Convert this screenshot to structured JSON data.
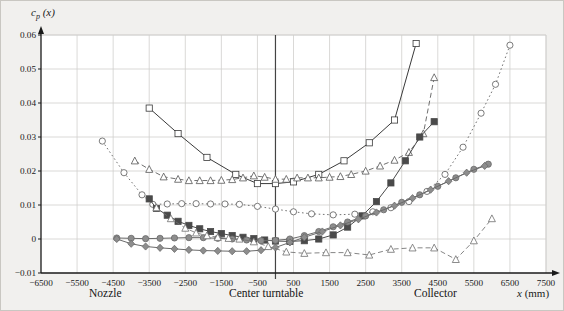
{
  "figure": {
    "background_color": "#f1f0ee",
    "plot_background_color": "#ffffff",
    "grid_color": "#d0cfcd",
    "axis_color": "#1a1a1a",
    "turntable_line_color": "#444444"
  },
  "labels": {
    "y_axis_title": "c_p (x)",
    "y_axis_title_main": "c",
    "y_axis_title_sub": "p",
    "y_axis_title_arg": "(x)",
    "x_axis_title": "x (mm)",
    "x_axis_title_main": "x",
    "x_axis_title_unit": "(mm)",
    "nozzle": "Nozzle",
    "center_turntable": "Center turntable",
    "collector": "Collector"
  },
  "chart_data": {
    "type": "line",
    "title": "",
    "xlabel": "x (mm)",
    "ylabel": "c_p (x)",
    "xlim": [
      -6500,
      7500
    ],
    "ylim": [
      -0.01,
      0.06
    ],
    "xticks": [
      -6500,
      -5500,
      -4500,
      -3500,
      -2500,
      -1500,
      -500,
      500,
      1500,
      2500,
      3500,
      4500,
      5500,
      6500,
      7500
    ],
    "xtick_labels": [
      "−6500",
      "−5500",
      "−4500",
      "−3500",
      "−2500",
      "−1500",
      "−500",
      "500",
      "1500",
      "2500",
      "3500",
      "4500",
      "5500",
      "6500",
      "7500"
    ],
    "yticks": [
      -0.01,
      0,
      0.01,
      0.02,
      0.03,
      0.04,
      0.05,
      0.06
    ],
    "ytick_labels": [
      "−0.01",
      "0",
      "0.01",
      "0.02",
      "0.03",
      "0.04",
      "0.05",
      "0.06"
    ],
    "grid": true,
    "legend": "none",
    "annotations": [
      {
        "text": "Nozzle",
        "x": -4000
      },
      {
        "text": "Center turntable",
        "x": 0
      },
      {
        "text": "Collector",
        "x": 4800
      }
    ],
    "vertical_reference_line": {
      "x": 0,
      "label": "Center turntable"
    },
    "series": [
      {
        "name": "open-square-solid",
        "marker": "square",
        "fill": "open",
        "linestyle": "solid",
        "color": "#3a3a3a",
        "x": [
          -3500,
          -2700,
          -1900,
          -1100,
          -500,
          0,
          500,
          1200,
          1900,
          2600,
          3300,
          3900
        ],
        "y": [
          0.0385,
          0.031,
          0.024,
          0.019,
          0.0163,
          0.0163,
          0.0168,
          0.019,
          0.023,
          0.0283,
          0.035,
          0.0575
        ]
      },
      {
        "name": "open-triangle-dashed-upper",
        "marker": "triangle",
        "fill": "open",
        "linestyle": "dashed",
        "color": "#555555",
        "x": [
          -3900,
          -3500,
          -3100,
          -2700,
          -2400,
          -2100,
          -1800,
          -1500,
          -1200,
          -900,
          -600,
          -300,
          0,
          300,
          600,
          900,
          1200,
          1500,
          1800,
          2100,
          2500,
          2900,
          3300,
          3700,
          4100,
          4400
        ],
        "y": [
          0.023,
          0.0205,
          0.0183,
          0.0176,
          0.0172,
          0.0172,
          0.0172,
          0.0173,
          0.0175,
          0.018,
          0.0186,
          0.0182,
          0.0176,
          0.0176,
          0.018,
          0.018,
          0.018,
          0.0182,
          0.0184,
          0.019,
          0.02,
          0.0215,
          0.0232,
          0.0255,
          0.031,
          0.0475
        ]
      },
      {
        "name": "open-circle-dotted",
        "marker": "circle",
        "fill": "open",
        "linestyle": "dotted",
        "color": "#5a5a5a",
        "x": [
          -4800,
          -4200,
          -3700,
          -3400,
          -3000,
          -2600,
          -2200,
          -1800,
          -1400,
          -1000,
          -500,
          0,
          500,
          1000,
          1600,
          2200,
          2700,
          3200,
          3700,
          4200,
          4700,
          5200,
          5700,
          6100,
          6500
        ],
        "y": [
          0.0288,
          0.0195,
          0.013,
          0.0102,
          0.0103,
          0.0104,
          0.0104,
          0.0103,
          0.0103,
          0.0102,
          0.0096,
          0.0088,
          0.008,
          0.0074,
          0.0071,
          0.0073,
          0.008,
          0.0092,
          0.011,
          0.014,
          0.019,
          0.027,
          0.037,
          0.0455,
          0.057
        ]
      },
      {
        "name": "filled-square-solid",
        "marker": "square",
        "fill": "filled",
        "linestyle": "solid",
        "color": "#4a4a4a",
        "x": [
          -3500,
          -3300,
          -3000,
          -2700,
          -2400,
          -2100,
          -1800,
          -1500,
          -1200,
          -900,
          -600,
          -300,
          0,
          400,
          800,
          1200,
          1600,
          2000,
          2400,
          2800,
          3200,
          3600,
          4000,
          4400
        ],
        "y": [
          0.0118,
          0.009,
          0.007,
          0.0052,
          0.004,
          0.003,
          0.0022,
          0.0016,
          0.001,
          0.0005,
          0.0001,
          -0.0003,
          -0.0006,
          -0.0007,
          -0.0005,
          0.0,
          0.0012,
          0.0035,
          0.0068,
          0.011,
          0.0165,
          0.023,
          0.03,
          0.0345
        ]
      },
      {
        "name": "filled-circle-solid",
        "marker": "circle",
        "fill": "shaded",
        "linestyle": "solid",
        "color": "#6a6a6a",
        "x": [
          -4400,
          -4000,
          -3600,
          -3200,
          -2800,
          -2400,
          -2000,
          -1600,
          -1200,
          -800,
          -400,
          0,
          400,
          800,
          1200,
          1600,
          2000,
          2500,
          3000,
          3500,
          4000,
          4500,
          5000,
          5500,
          5900
        ],
        "y": [
          0.0003,
          0.0002,
          0.0001,
          0.0002,
          0.0003,
          0.0004,
          0.0004,
          0.0002,
          0.0,
          -0.0003,
          -0.0005,
          -0.0004,
          0.0,
          0.001,
          0.0022,
          0.0036,
          0.005,
          0.0068,
          0.0086,
          0.0108,
          0.013,
          0.0155,
          0.018,
          0.0205,
          0.022
        ]
      },
      {
        "name": "filled-diamond-solid",
        "marker": "diamond",
        "fill": "shaded",
        "linestyle": "solid",
        "color": "#6a6a6a",
        "x": [
          -4400,
          -4000,
          -3600,
          -3200,
          -2800,
          -2400,
          -2000,
          -1600,
          -1200,
          -800,
          -400,
          0,
          400,
          800,
          1300,
          1800,
          2300,
          2800,
          3300,
          3800,
          4300,
          4800,
          5300,
          5800
        ],
        "y": [
          0.0,
          -0.0014,
          -0.0022,
          -0.0026,
          -0.0029,
          -0.0032,
          -0.0034,
          -0.0035,
          -0.0036,
          -0.0036,
          -0.0033,
          -0.0025,
          -0.001,
          0.0005,
          0.0022,
          0.004,
          0.0058,
          0.0078,
          0.0098,
          0.012,
          0.0145,
          0.017,
          0.0195,
          0.0215
        ]
      },
      {
        "name": "open-triangle-dashed-lower",
        "marker": "triangle",
        "fill": "open",
        "linestyle": "dashed",
        "color": "#6f6f6f",
        "x": [
          -3300,
          -2900,
          -2500,
          -2200,
          -1900,
          -1600,
          -1300,
          -1000,
          -600,
          -200,
          300,
          800,
          1400,
          2000,
          2600,
          3200,
          3800,
          4400,
          5000,
          5500,
          6000
        ],
        "y": [
          0.0092,
          0.006,
          0.0032,
          0.0018,
          0.001,
          0.0005,
          0.0002,
          0.0,
          -0.0008,
          -0.0022,
          -0.0038,
          -0.0042,
          -0.004,
          -0.004,
          -0.0047,
          -0.003,
          -0.0026,
          -0.0026,
          -0.006,
          -0.0005,
          0.006
        ]
      }
    ]
  }
}
